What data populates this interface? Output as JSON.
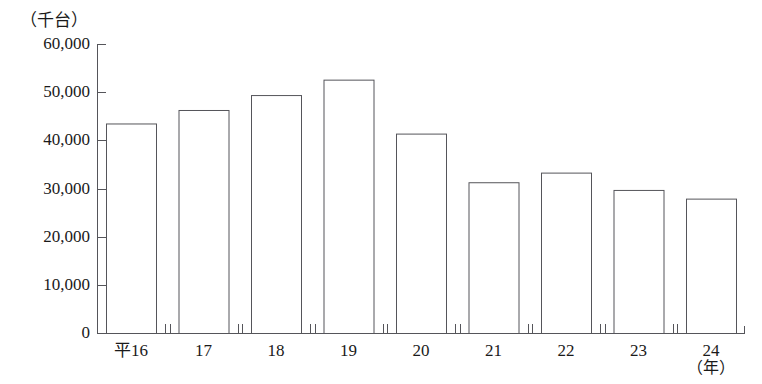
{
  "chart_data": {
    "type": "bar",
    "title": "",
    "subtitle": "",
    "xlabel": "（年）",
    "ylabel": "（千台）",
    "unit_note": "（千台）",
    "categories": [
      "平16",
      "17",
      "18",
      "19",
      "20",
      "21",
      "22",
      "23",
      "24"
    ],
    "values": [
      43500,
      46300,
      49400,
      52600,
      41400,
      31300,
      33300,
      29700,
      27900
    ],
    "ylim": [
      0,
      60000
    ],
    "ytick_values": [
      0,
      10000,
      20000,
      30000,
      40000,
      50000,
      60000
    ],
    "ytick_labels": [
      "0",
      "10,000",
      "20,000",
      "30,000",
      "40,000",
      "50,000",
      "60,000"
    ],
    "grid": false,
    "legend": null,
    "bar_style": {
      "fill": "#ffffff",
      "stroke": "#55555a",
      "stroke_width": 1
    },
    "axis_color": "#55555a"
  },
  "axes": {
    "x_label_suffix": "（年）"
  }
}
